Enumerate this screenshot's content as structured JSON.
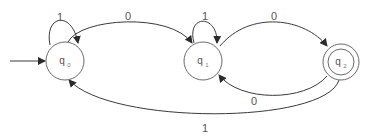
{
  "diagram": {
    "type": "DFA state diagram",
    "states": [
      {
        "id": "q0",
        "name": "q",
        "subscript": "0",
        "start": true,
        "accepting": false
      },
      {
        "id": "q1",
        "name": "q",
        "subscript": "1",
        "start": false,
        "accepting": false
      },
      {
        "id": "q2",
        "name": "q",
        "subscript": "2",
        "start": false,
        "accepting": true
      }
    ],
    "transitions": [
      {
        "from": "q0",
        "to": "q0",
        "label": "1"
      },
      {
        "from": "q0",
        "to": "q1",
        "label": "0"
      },
      {
        "from": "q1",
        "to": "q1",
        "label": "1"
      },
      {
        "from": "q1",
        "to": "q2",
        "label": "0"
      },
      {
        "from": "q2",
        "to": "q1",
        "label": "0"
      },
      {
        "from": "q2",
        "to": "q0",
        "label": "1"
      }
    ]
  }
}
